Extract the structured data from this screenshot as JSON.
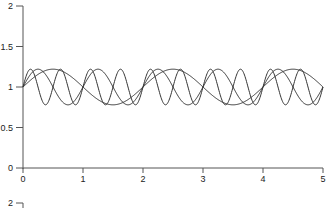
{
  "chart_data": {
    "type": "line",
    "title": "",
    "xlabel": "",
    "ylabel": "",
    "xlim": [
      0,
      5
    ],
    "ylim": [
      0,
      2
    ],
    "grid": false,
    "legend": null,
    "x_ticks": [
      "0",
      "1",
      "2",
      "3",
      "4",
      "5"
    ],
    "y_ticks": [
      "0",
      "0.5",
      "1",
      "1.5",
      "2"
    ],
    "series": [
      {
        "name": "slow",
        "formula": "1 + 0.22*sin(pi*x)",
        "amplitude": 0.22,
        "period": 2
      },
      {
        "name": "medium",
        "formula": "1 + 0.22*sin(2*pi*x)",
        "amplitude": 0.22,
        "period": 1
      },
      {
        "name": "fast",
        "formula": "1 + 0.22*sin(4*pi*x)",
        "amplitude": 0.22,
        "period": 0.5
      }
    ],
    "line_color": "#333333",
    "next_panel_top_tick": "2"
  }
}
